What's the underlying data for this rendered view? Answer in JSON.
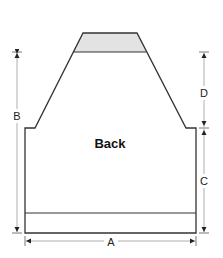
{
  "diagram": {
    "piece_label": "Back",
    "dimensions": {
      "A": "A",
      "B": "B",
      "C": "C",
      "D": "D"
    },
    "colors": {
      "outline": "#333333",
      "shaded_neck": "#e3e3e3",
      "dimension_line": "#9a9a9a",
      "arrowhead": "#222222"
    }
  }
}
